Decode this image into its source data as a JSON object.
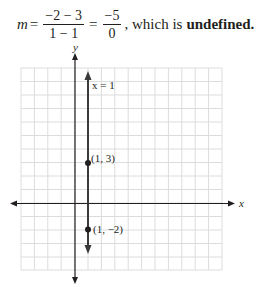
{
  "equation": {
    "lhs": "m",
    "eq": "=",
    "frac1": {
      "num": "−2 − 3",
      "den": "1 − 1"
    },
    "frac2": {
      "num": "−5",
      "den": "0"
    },
    "tail": ", which is",
    "conclusion": "undefined."
  },
  "graph": {
    "x_axis_label": "x",
    "y_axis_label": "y",
    "line_label": "x = 1",
    "points": [
      {
        "label": "(1, 3)",
        "x": 1,
        "y": 3
      },
      {
        "label": "(1, −2)",
        "x": 1,
        "y": -2
      }
    ],
    "colors": {
      "axis": "#231f20",
      "line": "#3a3a3a",
      "grid": "#d9d9d9"
    }
  }
}
